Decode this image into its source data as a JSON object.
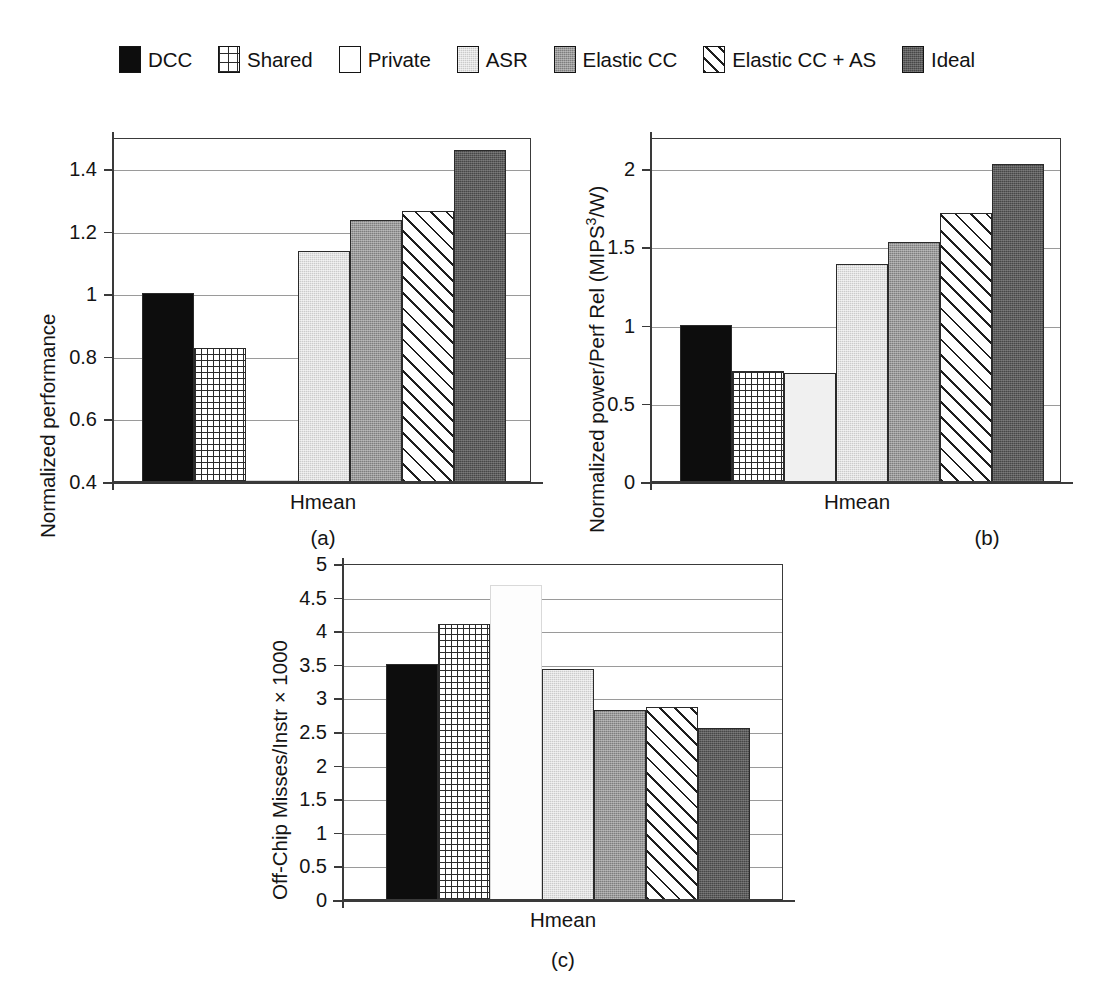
{
  "legend": {
    "items": [
      {
        "label": "DCC",
        "swatch": "solid-black-swatch",
        "fill": "fill-dcc"
      },
      {
        "label": "Shared",
        "swatch": "grid-hatch-swatch",
        "fill": "fill-shared"
      },
      {
        "label": "Private",
        "swatch": "white-swatch",
        "fill": "fill-private"
      },
      {
        "label": "ASR",
        "swatch": "light-gray-swatch",
        "fill": "fill-asr"
      },
      {
        "label": "Elastic CC",
        "swatch": "medium-gray-swatch",
        "fill": "fill-ecc"
      },
      {
        "label": "Elastic CC + AS",
        "swatch": "diagonal-hatch-swatch",
        "fill": "fill-eccas"
      },
      {
        "label": "Ideal",
        "swatch": "dark-gray-swatch",
        "fill": "fill-ideal"
      }
    ]
  },
  "colors": {
    "dcc": "#0d0d0d",
    "shared": "#ffffff",
    "private": "#ffffff",
    "asr": "#cbcbcb",
    "elastic_cc": "#7e7e7e",
    "elastic_cc_as": "#ffffff",
    "ideal": "#474747",
    "axis": "#3a3a3a",
    "gridline": "#9a9a9a"
  },
  "panels": [
    {
      "caption": "(a)",
      "xlabel": "Hmean"
    },
    {
      "caption": "(b)",
      "xlabel": "Hmean"
    },
    {
      "caption": "(c)",
      "xlabel": "Hmean"
    }
  ],
  "chart_data": [
    {
      "type": "bar",
      "panel": "(a)",
      "title": "",
      "xlabel": "Hmean",
      "ylabel": "Normalized performance",
      "categories": [
        "DCC",
        "Shared",
        "Private",
        "ASR",
        "Elastic CC",
        "Elastic CC + AS",
        "Ideal"
      ],
      "values": [
        1.0,
        0.825,
        0.4,
        1.135,
        1.235,
        1.265,
        1.46
      ],
      "ylim": [
        0.4,
        1.5
      ],
      "yticks": [
        0.4,
        0.6,
        0.8,
        1,
        1.2,
        1.4
      ],
      "ytick_labels": [
        "0.4",
        "0.6",
        "0.8",
        "1",
        "1.2",
        "1.4"
      ],
      "grid": true,
      "legend_position": "top-center"
    },
    {
      "type": "bar",
      "panel": "(b)",
      "title": "",
      "xlabel": "Hmean",
      "ylabel": "Normalized power/Perf Rel (MIPS3/W)",
      "categories": [
        "DCC",
        "Shared",
        "Private",
        "ASR",
        "Elastic CC",
        "Elastic CC + AS",
        "Ideal"
      ],
      "values": [
        1.0,
        0.705,
        0.69,
        1.39,
        1.53,
        1.715,
        2.03
      ],
      "ylim": [
        0,
        2.2
      ],
      "yticks": [
        0,
        0.5,
        1,
        1.5,
        2
      ],
      "ytick_labels": [
        "0",
        "0.5",
        "1",
        "1.5",
        "2"
      ],
      "grid": true,
      "legend_position": "top-center"
    },
    {
      "type": "bar",
      "panel": "(c)",
      "title": "",
      "xlabel": "Hmean",
      "ylabel": "Off-Chip Misses/Instr × 1000",
      "categories": [
        "DCC",
        "Shared",
        "Private",
        "ASR",
        "Elastic CC",
        "Elastic CC + AS",
        "Ideal"
      ],
      "values": [
        3.5,
        4.09,
        4.68,
        3.43,
        2.81,
        2.86,
        2.54
      ],
      "ylim": [
        0,
        5
      ],
      "yticks": [
        0,
        0.5,
        1,
        1.5,
        2,
        2.5,
        3,
        3.5,
        4,
        4.5,
        5
      ],
      "ytick_labels": [
        "0",
        "0.5",
        "1",
        "1.5",
        "2",
        "2.5",
        "3",
        "3.5",
        "4",
        "4.5",
        "5"
      ],
      "grid": true,
      "legend_position": "top-center"
    }
  ],
  "axis_titles": {
    "a_y": "Normalized performance",
    "b_y_pre": "Normalized power/Perf Rel (MIPS",
    "b_y_sup": "3",
    "b_y_post": "/W)",
    "c_y": "Off-Chip Misses/Instr × 1000"
  }
}
